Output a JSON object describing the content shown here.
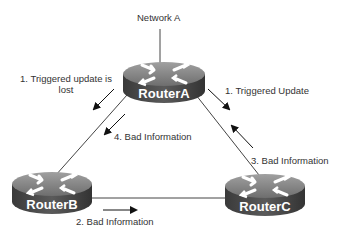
{
  "network": {
    "label": "Network A"
  },
  "routers": [
    {
      "id": "A",
      "label": "RouterA"
    },
    {
      "id": "B",
      "label": "RouterB"
    },
    {
      "id": "C",
      "label": "RouterC"
    }
  ],
  "annotations": {
    "step1_lost_line1": "1. Triggered update is",
    "step1_lost_line2": "lost",
    "step1_update": "1. Triggered Update",
    "step2": "2. Bad Information",
    "step3": "3. Bad Information",
    "step4": "4. Bad Information"
  },
  "links": [
    {
      "from": "Network A",
      "to": "RouterA"
    },
    {
      "from": "RouterA",
      "to": "RouterB"
    },
    {
      "from": "RouterA",
      "to": "RouterC"
    },
    {
      "from": "RouterB",
      "to": "RouterC"
    }
  ],
  "colors": {
    "router_top": "#8a8a8a",
    "router_side": "#4a4a4a",
    "line": "#333333",
    "text": "#333333"
  }
}
